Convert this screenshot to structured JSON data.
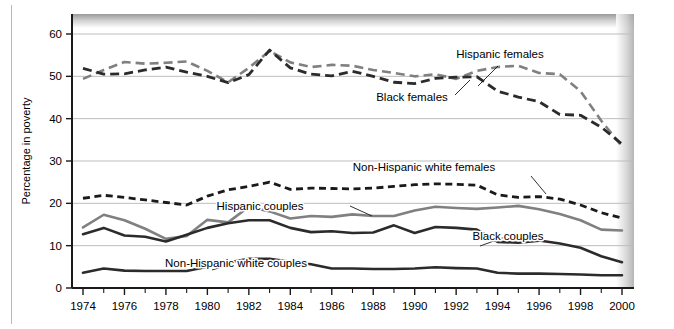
{
  "chart_data": {
    "type": "line",
    "title": "",
    "xlabel": "",
    "ylabel": "Percentage in poverty",
    "xlim": [
      1974,
      2000
    ],
    "ylim": [
      0,
      63
    ],
    "yticks": [
      0,
      10,
      20,
      30,
      40,
      50,
      60
    ],
    "ytick_labels": [
      "0",
      "10",
      "20",
      "30",
      "40",
      "50",
      "60"
    ],
    "xticks": [
      1974,
      1976,
      1978,
      1980,
      1982,
      1984,
      1986,
      1988,
      1990,
      1992,
      1994,
      1996,
      1998,
      2000
    ],
    "xtick_labels": [
      "1974",
      "1976",
      "1978",
      "1980",
      "1982",
      "1984",
      "1986",
      "1988",
      "1990",
      "1992",
      "1994",
      "1996",
      "1998",
      "2000"
    ],
    "xtick_minor": [
      1975,
      1977,
      1979,
      1981,
      1983,
      1985,
      1987,
      1989,
      1991,
      1993,
      1995,
      1997,
      1999
    ],
    "grid": "horizontal",
    "legend_position": "inline-annotations",
    "x": [
      1974,
      1975,
      1976,
      1977,
      1978,
      1979,
      1980,
      1981,
      1982,
      1983,
      1984,
      1985,
      1986,
      1987,
      1988,
      1989,
      1990,
      1991,
      1992,
      1993,
      1994,
      1995,
      1996,
      1997,
      1998,
      1999,
      2000
    ],
    "series": [
      {
        "name": "Hispanic females",
        "color": "#808080",
        "style": "dashed",
        "width": 2.6,
        "values": [
          49.4,
          51.5,
          53.4,
          53.0,
          53.2,
          53.5,
          51.3,
          48.6,
          52.0,
          56.0,
          53.3,
          52.2,
          52.7,
          52.5,
          51.5,
          50.8,
          50.0,
          50.5,
          49.4,
          51.3,
          52.2,
          52.5,
          50.8,
          50.5,
          46.5,
          39.5,
          33.5
        ]
      },
      {
        "name": "Black females",
        "color": "#2b2b2b",
        "style": "dashed",
        "width": 2.8,
        "values": [
          51.9,
          50.5,
          50.6,
          51.5,
          52.2,
          51.0,
          50.0,
          48.5,
          50.4,
          56.2,
          52.0,
          50.5,
          50.1,
          51.2,
          50.0,
          48.6,
          48.3,
          49.5,
          49.8,
          49.9,
          46.5,
          45.1,
          44.0,
          41.0,
          40.8,
          38.0,
          34.0
        ]
      },
      {
        "name": "Non-Hispanic white females",
        "color": "#1a1a1a",
        "style": "dotted-dash",
        "width": 2.8,
        "values": [
          21.2,
          21.9,
          21.4,
          20.8,
          20.2,
          19.6,
          21.7,
          23.2,
          24.0,
          25.0,
          23.3,
          23.6,
          23.5,
          23.4,
          23.6,
          24.0,
          24.4,
          24.6,
          24.5,
          24.3,
          22.0,
          21.4,
          21.6,
          21.0,
          19.6,
          17.8,
          16.5
        ]
      },
      {
        "name": "Hispanic couples",
        "color": "#808080",
        "style": "solid",
        "width": 2.6,
        "values": [
          14.3,
          17.3,
          16.0,
          14.0,
          11.6,
          12.3,
          16.1,
          15.5,
          19.2,
          18.1,
          16.4,
          17.0,
          16.8,
          17.4,
          17.0,
          17.0,
          18.3,
          19.2,
          18.9,
          18.7,
          19.0,
          19.4,
          18.6,
          17.5,
          16.0,
          13.8,
          13.6
        ]
      },
      {
        "name": "Black couples",
        "color": "#2b2b2b",
        "style": "solid",
        "width": 2.6,
        "values": [
          12.7,
          14.2,
          12.4,
          12.1,
          11.0,
          12.6,
          14.2,
          15.3,
          16.0,
          16.0,
          14.2,
          13.2,
          13.4,
          13.0,
          13.1,
          14.8,
          13.0,
          14.4,
          14.2,
          13.8,
          10.9,
          10.7,
          11.2,
          10.5,
          9.5,
          7.5,
          6.1
        ]
      },
      {
        "name": "Non-Hispanic white couples",
        "color": "#2b2b2b",
        "style": "solid",
        "width": 2.6,
        "values": [
          3.6,
          4.6,
          4.1,
          4.0,
          4.0,
          4.0,
          5.0,
          6.0,
          6.9,
          6.9,
          6.2,
          5.6,
          4.6,
          4.6,
          4.5,
          4.5,
          4.6,
          4.9,
          4.7,
          4.6,
          3.6,
          3.4,
          3.4,
          3.3,
          3.2,
          3.0,
          3.0
        ]
      }
    ],
    "annotations": [
      {
        "name": "hispanic-females",
        "label": "Hispanic females",
        "x": 500,
        "y": 58,
        "leader": [
          [
            498,
            66
          ],
          [
            478,
            86
          ]
        ]
      },
      {
        "name": "black-females",
        "label": "Black females",
        "x": 412,
        "y": 101,
        "leader": [
          [
            455,
            95
          ],
          [
            470,
            80
          ]
        ]
      },
      {
        "name": "non-hispanic-white-females",
        "label": "Non-Hispanic white females",
        "x": 424,
        "y": 171,
        "leader": [
          [
            531,
            176
          ],
          [
            546,
            194
          ]
        ]
      },
      {
        "name": "hispanic-couples",
        "label": "Hispanic couples",
        "x": 260,
        "y": 210,
        "leader": [
          [
            350,
            206
          ],
          [
            372,
            216
          ]
        ]
      },
      {
        "name": "black-couples",
        "label": "Black couples",
        "x": 508,
        "y": 240,
        "leader": [
          [
            505,
            237
          ],
          [
            480,
            246
          ]
        ]
      },
      {
        "name": "non-hispanic-white-couples",
        "label": "Non-Hispanic white couples",
        "x": 236,
        "y": 267,
        "leader": [
          [
            232,
            264
          ],
          [
            212,
            270
          ]
        ]
      }
    ]
  }
}
